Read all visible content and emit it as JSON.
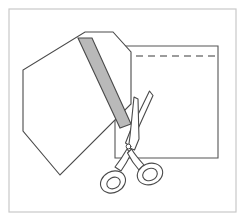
{
  "canvas": {
    "width": 245,
    "height": 221,
    "background_color": "#ffffff",
    "title": "Cutting diagram illustration"
  },
  "frame": {
    "name": "illustration-border",
    "x": 9,
    "y": 9,
    "width": 227,
    "height": 203,
    "stroke_color": "#c9c9c9",
    "stroke_width": 1.2,
    "fill": "none"
  },
  "shapes": {
    "back_panel": {
      "label": "fabric-panel-rectangle",
      "points": "115,46 218,46 218,158 115,158",
      "fill": "#ffffff",
      "stroke_color": "#555555",
      "stroke_width": 1.1
    },
    "dashed_guide": {
      "label": "dashed-cut-line",
      "x1": 124,
      "y1": 56,
      "x2": 216,
      "y2": 56,
      "stroke_color": "#3b3b3b",
      "stroke_width": 1.2,
      "dash_pattern": "7,5"
    },
    "tilted_panel": {
      "label": "tilted-fabric-piece",
      "points": "85,32 113,32 131,52 131,104 60,175 23,131 23,70",
      "fill": "#ffffff",
      "stroke_color": "#4a4a4a",
      "stroke_width": 1.1
    },
    "gray_band": {
      "label": "gray-ribbon-strip",
      "points": "78,38 92,38 131,124 120,128",
      "fill": "#b9b9b9",
      "stroke_color": "#4a4a4a",
      "stroke_width": 1.1
    }
  },
  "scissors": {
    "label": "scissors-tool",
    "stroke_color": "#4a4a4a",
    "stroke_width": 1.1,
    "fill": "#ffffff",
    "pivot": {
      "cx": 128,
      "cy": 145,
      "r": 2.4
    },
    "blade_upper": "148,92 152,96 133,140 127,143 126,137",
    "blade_lower": "131,100 135,101 136,142 130,146 127,141",
    "handle_left_arm": "127,148 120,160 112,168",
    "handle_right_arm": "131,147 139,156 146,163",
    "loop_left": {
      "cx": 112,
      "cy": 181,
      "rx": 12,
      "ry": 10,
      "rotate": -25,
      "inner_rx": 7,
      "inner_ry": 5.5
    },
    "loop_right": {
      "cx": 150,
      "cy": 173,
      "rx": 12,
      "ry": 10,
      "rotate": -20,
      "inner_rx": 7.5,
      "inner_ry": 6
    }
  },
  "colors": {
    "ink": "#4a4a4a",
    "ink_dark": "#3b3b3b",
    "gray_fill": "#b9b9b9",
    "border": "#c9c9c9",
    "paper": "#ffffff"
  }
}
